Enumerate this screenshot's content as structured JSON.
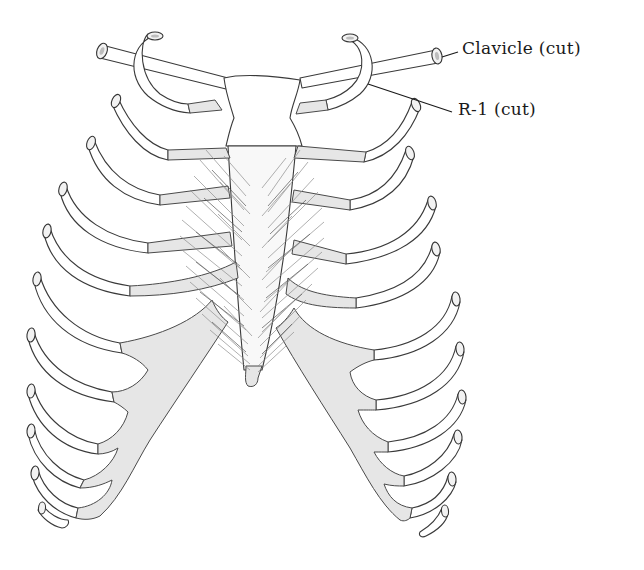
{
  "figure": {
    "labels": [
      {
        "id": "clavicle",
        "text": "Clavicle (cut)",
        "x": 462,
        "y": 36,
        "pointer_to": [
          442,
          57
        ]
      },
      {
        "id": "rib1",
        "text": "R-1 (cut)",
        "x": 477,
        "y": 93,
        "pointer_to": [
          420,
          84
        ]
      }
    ],
    "colors": {
      "background": "#ffffff",
      "outline": "#3a3a3a",
      "cartilage_fill": "#e6e6e6",
      "muscle_hatching": "#8a8a8a",
      "label_text": "#1a1a1a"
    },
    "structures": [
      "clavicle-left-cut",
      "clavicle-right-cut",
      "rib-1-left-cut",
      "rib-1-right-cut",
      "manubrium",
      "sternum-body",
      "xiphoid-process",
      "ribs-2-to-12-left",
      "ribs-2-to-12-right",
      "costal-cartilages",
      "costal-margin-left",
      "costal-margin-right",
      "transversus-thoracis-muscle"
    ],
    "rib_count_per_side": 12
  }
}
